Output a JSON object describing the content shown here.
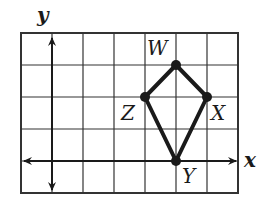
{
  "diagram": {
    "type": "coordinate-grid",
    "axes": {
      "x_label": "x",
      "y_label": "y"
    },
    "grid": {
      "columns": 7,
      "rows": 5,
      "origin_column": 1,
      "origin_row_from_bottom": 1
    },
    "shape": "kite",
    "vertices": [
      {
        "name": "W",
        "x": 3,
        "y": 3,
        "label_pos": "above-left"
      },
      {
        "name": "X",
        "x": 4,
        "y": 2,
        "label_pos": "below-right"
      },
      {
        "name": "Y",
        "x": 3,
        "y": 0,
        "label_pos": "below-right"
      },
      {
        "name": "Z",
        "x": 2,
        "y": 2,
        "label_pos": "below-left"
      }
    ],
    "colors": {
      "lines": "#1a1a1a",
      "background": "#ffffff"
    }
  }
}
